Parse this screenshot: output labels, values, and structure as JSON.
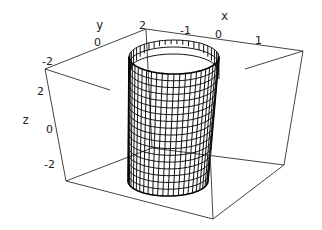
{
  "chart_data": {
    "type": "surface3d",
    "title": "",
    "axes": {
      "x": {
        "label": "x",
        "ticks": [
          "-1",
          "0",
          "1"
        ],
        "range": [
          -1.6,
          1.6
        ]
      },
      "y": {
        "label": "y",
        "ticks": [
          "-2",
          "0",
          "2"
        ],
        "range": [
          -2.6,
          2.6
        ]
      },
      "z": {
        "label": "z",
        "ticks": [
          "2",
          "0",
          "-2"
        ],
        "range": [
          -3,
          3
        ]
      }
    },
    "surface": {
      "shape": "elliptic-cylinder",
      "x_semi_axis": 1,
      "y_semi_axis": 2,
      "z_range": [
        -3,
        3
      ],
      "mesh_rows": 18,
      "mesh_columns": 48
    },
    "boxed": true,
    "grid": false
  },
  "geometry": {
    "box_top": [
      [
        45,
        69
      ],
      [
        146,
        29
      ],
      [
        303,
        51
      ],
      [
        208,
        87
      ]
    ],
    "box_bottom": [
      [
        66,
        181
      ],
      [
        152,
        148
      ],
      [
        284,
        165
      ],
      [
        213,
        219
      ]
    ],
    "top_ellipse": {
      "cx": 174,
      "cy": 57,
      "rx": 45,
      "ry": 17
    },
    "bottom_ellipse": {
      "cx": 168,
      "cy": 181,
      "rx": 40,
      "ry": 15
    }
  },
  "labels": {
    "y_axis": {
      "text": "y",
      "x": 96,
      "y": 29
    },
    "x_axis": {
      "text": "x",
      "x": 221,
      "y": 20
    },
    "z_axis": {
      "text": "z",
      "x": 22,
      "y": 124
    },
    "y_ticks": [
      {
        "text": "-2",
        "x": 42,
        "y": 65
      },
      {
        "text": "0",
        "x": 94,
        "y": 46
      },
      {
        "text": "2",
        "x": 139,
        "y": 29
      }
    ],
    "x_ticks": [
      {
        "text": "-1",
        "x": 180,
        "y": 34
      },
      {
        "text": "0",
        "x": 215,
        "y": 38
      },
      {
        "text": "1",
        "x": 255,
        "y": 44
      }
    ],
    "z_ticks": [
      {
        "text": "2",
        "x": 37,
        "y": 95
      },
      {
        "text": "0",
        "x": 46,
        "y": 133
      },
      {
        "text": "-2",
        "x": 44,
        "y": 168
      }
    ]
  }
}
